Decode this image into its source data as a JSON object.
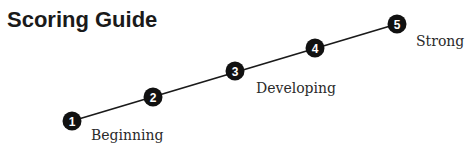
{
  "title": "Scoring Guide",
  "colors": {
    "line": "#1a1a1a",
    "marker": "#111111",
    "marker_text": "#ffffff"
  },
  "scale": {
    "points": [
      {
        "number": "1",
        "cx": 72,
        "cy": 121
      },
      {
        "number": "2",
        "cx": 153,
        "cy": 97
      },
      {
        "number": "3",
        "cx": 235,
        "cy": 71
      },
      {
        "number": "4",
        "cx": 315,
        "cy": 48
      },
      {
        "number": "5",
        "cx": 397,
        "cy": 24
      }
    ],
    "labels": [
      {
        "text": "Beginning",
        "x": 91,
        "y": 127
      },
      {
        "text": "Developing",
        "x": 256,
        "y": 80
      },
      {
        "text": "Strong",
        "x": 416,
        "y": 33
      }
    ]
  }
}
